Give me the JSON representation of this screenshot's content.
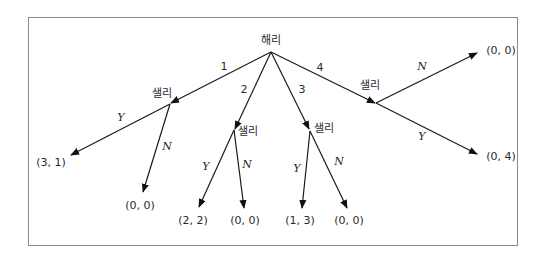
{
  "diagram": {
    "type": "game-tree",
    "root": {
      "player": "해리"
    },
    "harry_actions": [
      "1",
      "2",
      "3",
      "4"
    ],
    "sally_nodes": [
      {
        "player": "샐리",
        "after_action": "1",
        "branches": [
          {
            "action": "Y",
            "payoff": "(3, 1)"
          },
          {
            "action": "N",
            "payoff": "(0, 0)"
          }
        ]
      },
      {
        "player": "샐리",
        "after_action": "2",
        "branches": [
          {
            "action": "Y",
            "payoff": "(2, 2)"
          },
          {
            "action": "N",
            "payoff": "(0, 0)"
          }
        ]
      },
      {
        "player": "샐리",
        "after_action": "3",
        "branches": [
          {
            "action": "Y",
            "payoff": "(1, 3)"
          },
          {
            "action": "N",
            "payoff": "(0, 0)"
          }
        ]
      },
      {
        "player": "샐리",
        "after_action": "4",
        "branches": [
          {
            "action": "N",
            "payoff": "(0, 0)"
          },
          {
            "action": "Y",
            "payoff": "(0, 4)"
          }
        ]
      }
    ]
  },
  "colors": {
    "line": "#1a1a1a",
    "frame": "#8a8a8a",
    "text": "#2a2a2a",
    "background": "#ffffff"
  }
}
